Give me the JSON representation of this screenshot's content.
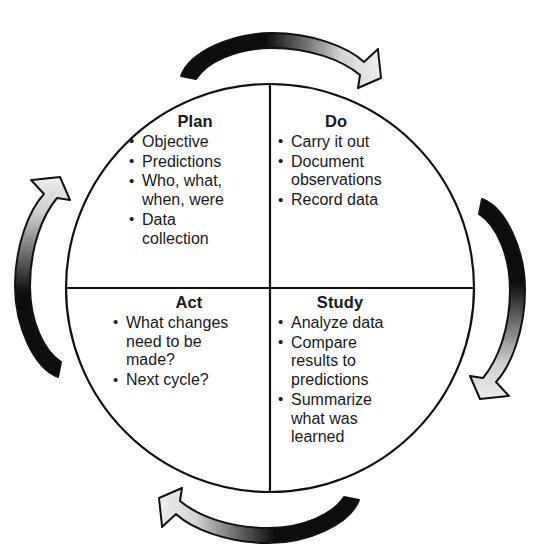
{
  "diagram": {
    "name": "PDSA Cycle",
    "type": "cyclic-quadrant-wheel",
    "colors": {
      "stroke": "#111111",
      "background": "#ffffff",
      "arrow_dark": "#0d0d0d",
      "arrow_light": "#e2e2e2",
      "arrow_mid": "#8a8a8a"
    },
    "geometry": {
      "center_x": 270,
      "center_y": 288,
      "radius": 205
    }
  },
  "quadrants": {
    "plan": {
      "title": "Plan",
      "position": "top-left",
      "items": [
        "Objective",
        "Predictions",
        "Who, what,\nwhen, were",
        "Data\ncollection"
      ]
    },
    "do": {
      "title": "Do",
      "position": "top-right",
      "items": [
        "Carry it out",
        "Document\nobservations",
        "Record data"
      ]
    },
    "act": {
      "title": "Act",
      "position": "bottom-left",
      "items": [
        "What changes\nneed to be\nmade?",
        "Next cycle?"
      ]
    },
    "study": {
      "title": "Study",
      "position": "bottom-right",
      "items": [
        "Analyze data",
        "Compare\nresults to\npredictions",
        "Summarize\nwhat was\nlearned"
      ]
    }
  },
  "bullet": "•",
  "arrows": [
    {
      "id": "top-arrow",
      "direction": "clockwise-right",
      "from": "Plan",
      "to": "Do"
    },
    {
      "id": "right-arrow",
      "direction": "clockwise-down",
      "from": "Do",
      "to": "Study"
    },
    {
      "id": "bottom-arrow",
      "direction": "clockwise-left",
      "from": "Study",
      "to": "Act"
    },
    {
      "id": "left-arrow",
      "direction": "clockwise-up",
      "from": "Act",
      "to": "Plan"
    }
  ]
}
